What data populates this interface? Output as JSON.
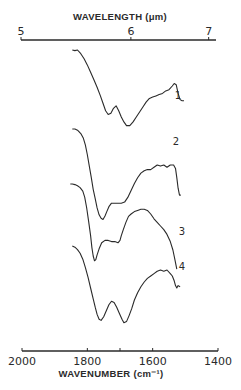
{
  "chart_data": {
    "type": "line",
    "title": "",
    "xlabel": "WAVENUMBER (cm⁻¹)",
    "x2label": "WAVELENGTH (μm)",
    "ylabel": "",
    "xlim": [
      2000,
      1400
    ],
    "x_ticks": [
      {
        "value": 2000,
        "label": "2000"
      },
      {
        "value": 1800,
        "label": "1800"
      },
      {
        "value": 1700,
        "label": ""
      },
      {
        "value": 1600,
        "label": "1600"
      },
      {
        "value": 1400,
        "label": "1400"
      }
    ],
    "x2_ticks": [
      {
        "value": 5,
        "label": "5"
      },
      {
        "value": 6,
        "label": "6"
      },
      {
        "value": 7,
        "label": "7"
      }
    ],
    "grid": false,
    "legend": "inline curve labels",
    "series": [
      {
        "name": "1",
        "points": [
          [
            1846,
            0.0
          ],
          [
            1838,
            0.01
          ],
          [
            1830,
            0.0
          ],
          [
            1820,
            0.06
          ],
          [
            1810,
            0.14
          ],
          [
            1800,
            0.24
          ],
          [
            1790,
            0.36
          ],
          [
            1780,
            0.48
          ],
          [
            1770,
            0.6
          ],
          [
            1760,
            0.74
          ],
          [
            1752,
            0.86
          ],
          [
            1744,
            0.98
          ],
          [
            1736,
            1.04
          ],
          [
            1728,
            1.02
          ],
          [
            1720,
            0.94
          ],
          [
            1712,
            0.9
          ],
          [
            1704,
            0.98
          ],
          [
            1696,
            1.08
          ],
          [
            1688,
            1.16
          ],
          [
            1680,
            1.22
          ],
          [
            1670,
            1.22
          ],
          [
            1660,
            1.16
          ],
          [
            1650,
            1.08
          ],
          [
            1640,
            1.0
          ],
          [
            1630,
            0.92
          ],
          [
            1620,
            0.84
          ],
          [
            1610,
            0.78
          ],
          [
            1600,
            0.76
          ],
          [
            1590,
            0.74
          ],
          [
            1580,
            0.72
          ],
          [
            1570,
            0.7
          ],
          [
            1560,
            0.66
          ],
          [
            1550,
            0.64
          ],
          [
            1540,
            0.58
          ],
          [
            1534,
            0.54
          ],
          [
            1528,
            0.56
          ],
          [
            1522,
            0.7
          ],
          [
            1516,
            0.8
          ],
          [
            1510,
            0.82
          ],
          [
            1504,
            0.82
          ]
        ]
      },
      {
        "name": "2",
        "points": [
          [
            1846,
            0.0
          ],
          [
            1838,
            0.0
          ],
          [
            1830,
            0.02
          ],
          [
            1820,
            0.08
          ],
          [
            1812,
            0.16
          ],
          [
            1806,
            0.28
          ],
          [
            1800,
            0.44
          ],
          [
            1794,
            0.64
          ],
          [
            1788,
            0.84
          ],
          [
            1782,
            1.04
          ],
          [
            1776,
            1.2
          ],
          [
            1770,
            1.36
          ],
          [
            1764,
            1.48
          ],
          [
            1758,
            1.54
          ],
          [
            1752,
            1.56
          ],
          [
            1746,
            1.5
          ],
          [
            1740,
            1.42
          ],
          [
            1734,
            1.34
          ],
          [
            1726,
            1.28
          ],
          [
            1716,
            1.28
          ],
          [
            1706,
            1.28
          ],
          [
            1696,
            1.28
          ],
          [
            1686,
            1.26
          ],
          [
            1676,
            1.18
          ],
          [
            1666,
            1.06
          ],
          [
            1656,
            0.94
          ],
          [
            1646,
            0.84
          ],
          [
            1636,
            0.76
          ],
          [
            1626,
            0.72
          ],
          [
            1616,
            0.7
          ],
          [
            1606,
            0.7
          ],
          [
            1596,
            0.66
          ],
          [
            1586,
            0.62
          ],
          [
            1576,
            0.64
          ],
          [
            1566,
            0.62
          ],
          [
            1556,
            0.66
          ],
          [
            1546,
            0.62
          ],
          [
            1536,
            0.62
          ],
          [
            1530,
            0.68
          ],
          [
            1526,
            0.84
          ],
          [
            1522,
            1.02
          ],
          [
            1518,
            1.14
          ],
          [
            1514,
            1.14
          ]
        ]
      },
      {
        "name": "3",
        "points": [
          [
            1852,
            0.0
          ],
          [
            1846,
            0.0
          ],
          [
            1838,
            0.01
          ],
          [
            1830,
            0.03
          ],
          [
            1822,
            0.06
          ],
          [
            1814,
            0.12
          ],
          [
            1808,
            0.22
          ],
          [
            1802,
            0.4
          ],
          [
            1796,
            0.62
          ],
          [
            1790,
            0.86
          ],
          [
            1786,
            1.06
          ],
          [
            1782,
            1.2
          ],
          [
            1778,
            1.28
          ],
          [
            1774,
            1.26
          ],
          [
            1770,
            1.18
          ],
          [
            1764,
            1.08
          ],
          [
            1756,
            0.98
          ],
          [
            1746,
            0.94
          ],
          [
            1736,
            0.94
          ],
          [
            1726,
            0.96
          ],
          [
            1716,
            0.96
          ],
          [
            1706,
            0.98
          ],
          [
            1700,
            0.94
          ],
          [
            1696,
            0.86
          ],
          [
            1690,
            0.76
          ],
          [
            1682,
            0.64
          ],
          [
            1674,
            0.54
          ],
          [
            1666,
            0.5
          ],
          [
            1656,
            0.46
          ],
          [
            1646,
            0.44
          ],
          [
            1636,
            0.42
          ],
          [
            1626,
            0.42
          ],
          [
            1616,
            0.44
          ],
          [
            1606,
            0.5
          ],
          [
            1596,
            0.58
          ],
          [
            1586,
            0.64
          ],
          [
            1576,
            0.7
          ],
          [
            1566,
            0.76
          ],
          [
            1556,
            0.84
          ],
          [
            1546,
            0.96
          ],
          [
            1538,
            1.1
          ],
          [
            1532,
            1.26
          ],
          [
            1526,
            1.42
          ]
        ]
      },
      {
        "name": "4",
        "points": [
          [
            1846,
            0.0
          ],
          [
            1838,
            0.02
          ],
          [
            1830,
            0.06
          ],
          [
            1822,
            0.12
          ],
          [
            1814,
            0.22
          ],
          [
            1806,
            0.36
          ],
          [
            1798,
            0.52
          ],
          [
            1790,
            0.7
          ],
          [
            1782,
            0.88
          ],
          [
            1776,
            1.02
          ],
          [
            1770,
            1.14
          ],
          [
            1764,
            1.22
          ],
          [
            1758,
            1.24
          ],
          [
            1750,
            1.18
          ],
          [
            1742,
            1.08
          ],
          [
            1734,
            0.98
          ],
          [
            1726,
            0.92
          ],
          [
            1718,
            0.94
          ],
          [
            1710,
            1.02
          ],
          [
            1702,
            1.12
          ],
          [
            1694,
            1.22
          ],
          [
            1688,
            1.28
          ],
          [
            1680,
            1.26
          ],
          [
            1672,
            1.16
          ],
          [
            1664,
            1.04
          ],
          [
            1656,
            0.9
          ],
          [
            1646,
            0.78
          ],
          [
            1636,
            0.68
          ],
          [
            1626,
            0.6
          ],
          [
            1616,
            0.54
          ],
          [
            1606,
            0.5
          ],
          [
            1596,
            0.46
          ],
          [
            1586,
            0.42
          ],
          [
            1576,
            0.4
          ],
          [
            1566,
            0.42
          ],
          [
            1556,
            0.4
          ],
          [
            1546,
            0.46
          ],
          [
            1540,
            0.5
          ],
          [
            1534,
            0.58
          ],
          [
            1530,
            0.66
          ],
          [
            1526,
            0.7
          ],
          [
            1522,
            0.66
          ],
          [
            1516,
            0.68
          ]
        ]
      }
    ]
  }
}
